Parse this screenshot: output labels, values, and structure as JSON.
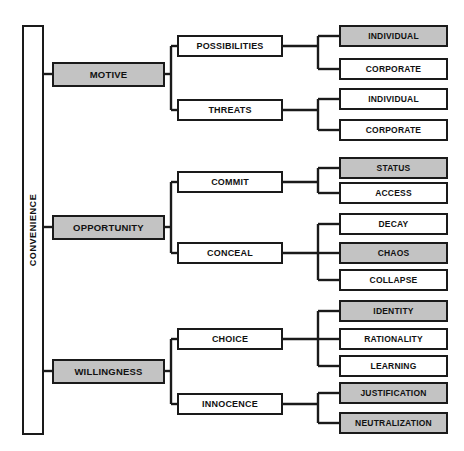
{
  "figure": {
    "root": {
      "label": "CONVENIENCE",
      "shaded": false
    },
    "level1": [
      {
        "label": "MOTIVE",
        "shaded": true
      },
      {
        "label": "OPPORTUNITY",
        "shaded": true
      },
      {
        "label": "WILLINGNESS",
        "shaded": true
      }
    ],
    "level2": [
      {
        "label": "POSSIBILITIES",
        "shaded": false
      },
      {
        "label": "THREATS",
        "shaded": false
      },
      {
        "label": "COMMIT",
        "shaded": false
      },
      {
        "label": "CONCEAL",
        "shaded": false
      },
      {
        "label": "CHOICE",
        "shaded": false
      },
      {
        "label": "INNOCENCE",
        "shaded": false
      }
    ],
    "level3": [
      {
        "label": "INDIVIDUAL",
        "shaded": true
      },
      {
        "label": "CORPORATE",
        "shaded": false
      },
      {
        "label": "INDIVIDUAL",
        "shaded": false
      },
      {
        "label": "CORPORATE",
        "shaded": false
      },
      {
        "label": "STATUS",
        "shaded": true
      },
      {
        "label": "ACCESS",
        "shaded": false
      },
      {
        "label": "DECAY",
        "shaded": false
      },
      {
        "label": "CHAOS",
        "shaded": true
      },
      {
        "label": "COLLAPSE",
        "shaded": false
      },
      {
        "label": "IDENTITY",
        "shaded": true
      },
      {
        "label": "RATIONALITY",
        "shaded": false
      },
      {
        "label": "LEARNING",
        "shaded": false
      },
      {
        "label": "JUSTIFICATION",
        "shaded": true
      },
      {
        "label": "NEUTRALIZATION",
        "shaded": true
      }
    ],
    "caption": "",
    "colors": {
      "shade_fill": "#c3c3c3",
      "plain_fill": "#ffffff",
      "stroke": "#1a1a1a"
    }
  }
}
